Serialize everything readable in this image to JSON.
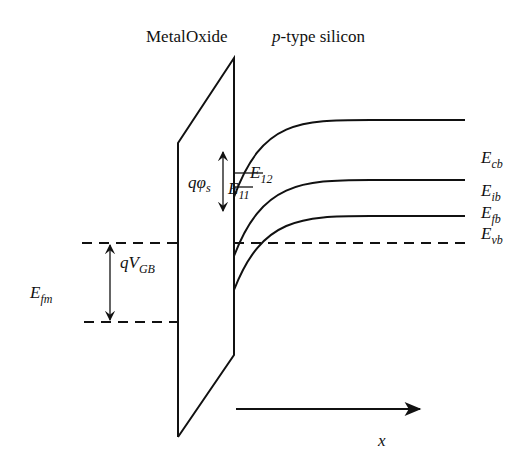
{
  "diagram": {
    "type": "MOS energy band diagram",
    "region_labels": {
      "metal": "Metal",
      "oxide": "Oxide",
      "silicon_prefix": "p",
      "silicon_suffix": "-type silicon"
    },
    "band_labels": {
      "conduction": {
        "main": "E",
        "sub": "cb"
      },
      "intrinsic": {
        "main": "E",
        "sub": "ib"
      },
      "fermi_semiconductor": {
        "main": "E",
        "sub": "fb"
      },
      "valence": {
        "main": "E",
        "sub": "vb"
      },
      "fermi_metal": {
        "main": "E",
        "sub": "fm"
      }
    },
    "subband_labels": {
      "e12": {
        "main": "E",
        "sub": "12"
      },
      "e11": {
        "main": "E",
        "sub": "11"
      }
    },
    "arrow_labels": {
      "surface_potential": {
        "q": "q",
        "sym": "φ",
        "sub": "s"
      },
      "gate_voltage": {
        "q": "q",
        "sym": "V",
        "sub": "GB"
      }
    },
    "axis_label": "x",
    "colors": {
      "line": "#111111",
      "background": "#ffffff"
    }
  }
}
